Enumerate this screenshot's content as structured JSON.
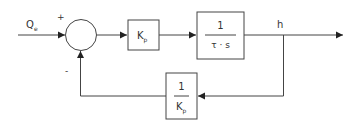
{
  "diagram": {
    "type": "feedback-control-block-diagram",
    "input": {
      "label_main": "Q",
      "label_sub": "e"
    },
    "summing_junction": {
      "plus_sign": "+",
      "minus_sign": "-"
    },
    "blocks": [
      {
        "id": "gain",
        "label_main": "K",
        "label_sub": "p"
      },
      {
        "id": "integrator",
        "numerator": "1",
        "denominator": "τ · s"
      },
      {
        "id": "feedback",
        "numerator": "1",
        "denominator_main": "K",
        "denominator_sub": "p"
      }
    ],
    "output": {
      "label": "h"
    },
    "colors": {
      "line": "#444444",
      "text": "#333333",
      "background": "#ffffff"
    }
  }
}
